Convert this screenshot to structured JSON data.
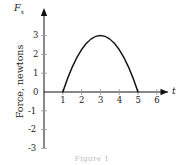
{
  "figure": {
    "y_axis_label": "Force, newtons",
    "y_axis_symbol": "F",
    "y_axis_subscript": "x",
    "x_axis_symbol": "t",
    "caption": "Figure 1"
  },
  "chart_data": {
    "type": "line",
    "title": "",
    "xlabel": "t",
    "ylabel": "Force, newtons",
    "xlim": [
      0,
      6.8
    ],
    "ylim": [
      -3,
      3.4
    ],
    "xticks": [
      1,
      2,
      3,
      4,
      5,
      6
    ],
    "yticks": [
      3,
      2,
      1,
      0,
      -1,
      -2,
      -3
    ],
    "xtick_labels": [
      "1",
      "2",
      "3",
      "4",
      "5",
      "6"
    ],
    "ytick_labels": [
      "3",
      "2",
      "1",
      "0",
      "-1",
      "-2",
      "-3"
    ],
    "grid": false,
    "legend": "none",
    "axis_arrows": true,
    "curve_color": "#111111",
    "axis_color": "#111111",
    "tick_color": "#9a9a9a",
    "series": [
      {
        "name": "Fx(t)",
        "description": "Parabola peaking at 3 N, zero at t=1 and t=5",
        "x": [
          1.0,
          1.25,
          1.5,
          1.75,
          2.0,
          2.25,
          2.5,
          2.75,
          3.0,
          3.25,
          3.5,
          3.75,
          4.0,
          4.25,
          4.5,
          4.75,
          5.0
        ],
        "y": [
          0.0,
          0.547,
          1.031,
          1.453,
          1.8125,
          2.109,
          2.344,
          2.516,
          2.625,
          2.516,
          2.344,
          2.109,
          1.8125,
          1.453,
          1.031,
          0.547,
          0.0
        ],
        "peak_x": 3,
        "peak_y": 3,
        "roots": [
          1,
          5
        ]
      }
    ]
  }
}
